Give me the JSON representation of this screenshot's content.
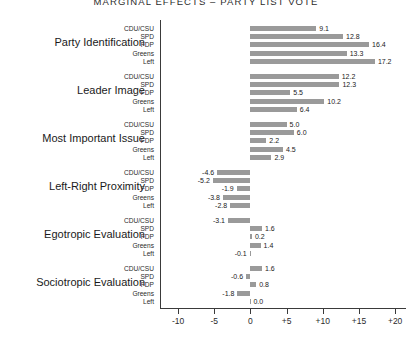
{
  "chart_data": {
    "type": "bar",
    "title": "MARGINAL EFFECTS – PARTY LIST VOTE",
    "xlabel": "",
    "ylabel": "",
    "orientation": "horizontal",
    "grid": false,
    "legend": "none",
    "xlim": [
      -12.5,
      21.5
    ],
    "xticks": [
      -10,
      -5,
      0,
      5,
      10,
      15,
      20
    ],
    "xtick_labels": [
      "-10",
      "-5",
      "0",
      "+5",
      "+10",
      "+15",
      "+20"
    ],
    "categories": [
      "CDU/CSU",
      "SPD",
      "FDP",
      "Greens",
      "Left"
    ],
    "bar_color": "#9a9a9a",
    "groups": [
      {
        "label": "Party Identification",
        "values": [
          9.1,
          12.8,
          16.4,
          13.3,
          17.2
        ],
        "value_labels": [
          "9.1",
          "12.8",
          "16.4",
          "13.3",
          "17.2"
        ]
      },
      {
        "label": "Leader Image",
        "values": [
          12.2,
          12.3,
          5.5,
          10.2,
          6.4
        ],
        "value_labels": [
          "12.2",
          "12.3",
          "5.5",
          "10.2",
          "6.4"
        ]
      },
      {
        "label": "Most Important Issue",
        "values": [
          5.0,
          6.0,
          2.2,
          4.5,
          2.9
        ],
        "value_labels": [
          "5.0",
          "6.0",
          "2.2",
          "4.5",
          "2.9"
        ]
      },
      {
        "label": "Left-Right Proximity",
        "values": [
          -4.6,
          -5.2,
          -1.9,
          -3.8,
          -2.8
        ],
        "value_labels": [
          "-4.6",
          "-5.2",
          "-1.9",
          "-3.8",
          "-2.8"
        ]
      },
      {
        "label": "Egotropic Evaluation",
        "values": [
          -3.1,
          1.6,
          0.2,
          1.4,
          -0.1
        ],
        "value_labels": [
          "-3.1",
          "1.6",
          "0.2",
          "1.4",
          "-0.1"
        ]
      },
      {
        "label": "Sociotropic Evaluation",
        "values": [
          1.6,
          -0.6,
          0.8,
          -1.8,
          0.0
        ],
        "value_labels": [
          "1.6",
          "-0.6",
          "0.8",
          "-1.8",
          "0.0"
        ]
      }
    ]
  }
}
